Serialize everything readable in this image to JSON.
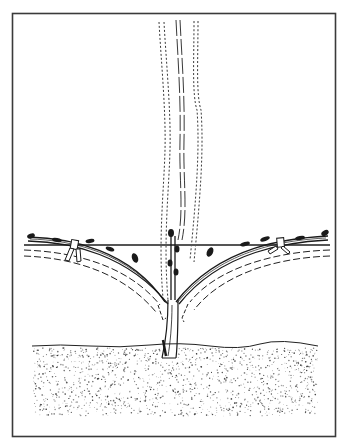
{
  "figure": {
    "style": "black-and-white line illustration",
    "colors": {
      "background": "#ffffff",
      "ink": "#1a1a1a",
      "frame": "#3a3a3a",
      "wire": "#555555",
      "soil_stipple": "#333333"
    },
    "elements": {
      "frame": "rectangular border",
      "trunk": "single vertical trunk emerging from soil",
      "arms": [
        "left cordon arm tied to wire",
        "right cordon arm tied to wire"
      ],
      "central_shoot": "upright short shoot with buds at center",
      "dashed_canes": "dashed outlines of canes rising vertically above wire",
      "dashed_arm_outlines": "dashed curved outlines below each arm",
      "ties": [
        "left tie",
        "right tie"
      ],
      "wire": "horizontal trellis wire",
      "soil": "stippled ground band"
    }
  }
}
